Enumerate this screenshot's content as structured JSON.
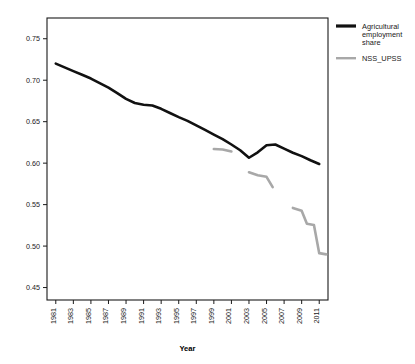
{
  "chart_data": {
    "type": "line",
    "title": "",
    "xlabel": "Year",
    "ylabel": "",
    "xlim": [
      1980,
      2012
    ],
    "ylim": [
      0.435,
      0.775
    ],
    "grid": false,
    "legend_position": "right",
    "x_ticks": [
      1981,
      1983,
      1985,
      1987,
      1989,
      1991,
      1993,
      1995,
      1997,
      1999,
      2001,
      2003,
      2005,
      2007,
      2009,
      2011
    ],
    "x_tick_labels": [
      "1981",
      "1983",
      "1985",
      "1987",
      "1989",
      "1991",
      "1993",
      "1995",
      "1997",
      "1999",
      "2001",
      "2003",
      "2005",
      "2007",
      "2009",
      "2011"
    ],
    "y_ticks": [
      0.45,
      0.5,
      0.55,
      0.6,
      0.65,
      0.7,
      0.75
    ],
    "y_tick_labels": [
      "0.45",
      "0.50",
      "0.55",
      "0.60",
      "0.65",
      "0.70",
      "0.75"
    ],
    "series": [
      {
        "name": "Agricultural employment share",
        "color": "#111111",
        "width": 2.6,
        "segments": [
          [
            [
              1981,
              0.72
            ],
            [
              1982,
              0.7155
            ],
            [
              1983,
              0.711
            ],
            [
              1984,
              0.7065
            ],
            [
              1985,
              0.702
            ],
            [
              1986,
              0.6965
            ],
            [
              1987,
              0.691
            ],
            [
              1988,
              0.6845
            ],
            [
              1989,
              0.6775
            ],
            [
              1990,
              0.6725
            ],
            [
              1991,
              0.6705
            ],
            [
              1992,
              0.6695
            ],
            [
              1993,
              0.6655
            ],
            [
              1994,
              0.6605
            ],
            [
              1995,
              0.6555
            ],
            [
              1996,
              0.651
            ],
            [
              1997,
              0.6455
            ],
            [
              1998,
              0.64
            ],
            [
              1999,
              0.6345
            ],
            [
              2000,
              0.629
            ],
            [
              2001,
              0.6225
            ],
            [
              2002,
              0.6155
            ],
            [
              2003,
              0.6065
            ],
            [
              2004,
              0.613
            ],
            [
              2005,
              0.6215
            ],
            [
              2006,
              0.6225
            ],
            [
              2007,
              0.6175
            ],
            [
              2008,
              0.6125
            ],
            [
              2009,
              0.6085
            ],
            [
              2010,
              0.6035
            ],
            [
              2011,
              0.599
            ]
          ]
        ]
      },
      {
        "name": "NSS_UPSS",
        "color": "#a8a8a8",
        "width": 2.6,
        "segments": [
          [
            [
              1999,
              0.617
            ],
            [
              2000,
              0.6165
            ],
            [
              2001,
              0.614
            ]
          ],
          [
            [
              2003,
              0.589
            ],
            [
              2004,
              0.5855
            ],
            [
              2005,
              0.5835
            ],
            [
              2005.7,
              0.571
            ]
          ],
          [
            [
              2008,
              0.546
            ],
            [
              2009,
              0.5425
            ],
            [
              2009.6,
              0.527
            ],
            [
              2010.4,
              0.5255
            ],
            [
              2011,
              0.4915
            ],
            [
              2011.8,
              0.49
            ]
          ]
        ]
      }
    ],
    "legend_entries": [
      {
        "label_lines": [
          "Agricultural",
          "employment",
          "share"
        ],
        "color": "#111111"
      },
      {
        "label_lines": [
          "NSS_UPSS"
        ],
        "color": "#a8a8a8"
      }
    ]
  },
  "figure": {
    "background_color": "#ffffff",
    "axis_color": "#1a1a1a",
    "caption_fragment": ""
  }
}
